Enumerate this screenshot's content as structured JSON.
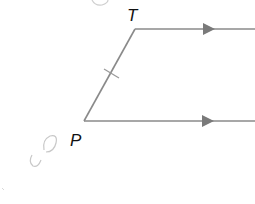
{
  "diagram": {
    "type": "geometry-figure",
    "labels": {
      "top_vertex": "T",
      "bottom_vertex": "P"
    },
    "points": {
      "T": [
        135,
        29
      ],
      "P": [
        84,
        121
      ]
    },
    "segments": [
      {
        "name": "PT",
        "from": "P",
        "to": "T",
        "tick_marks": 1
      },
      {
        "name": "ray-from-T",
        "from": "T",
        "to_x": 255,
        "parallel_arrow": true
      },
      {
        "name": "ray-from-P",
        "from": "P",
        "to_x": 255,
        "parallel_arrow": true
      }
    ],
    "annotations": {
      "handwritten_marks": [
        "faint pencil scribble near top",
        "faint pencil scribble left of P"
      ]
    },
    "colors": {
      "line": "#8a8a8a",
      "label": "#111111",
      "pencil": "#c8c8c8"
    }
  }
}
